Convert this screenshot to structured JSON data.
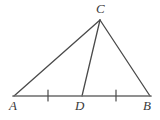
{
  "figure": {
    "kind": "geometry-diagram",
    "background_color": "#ffffff",
    "stroke_color": "#4a4a4a",
    "base_stroke_color": "#6b6b6b",
    "label_color": "#3a3a3a",
    "width": 160,
    "height": 120,
    "points": {
      "A": {
        "label": "A",
        "x": 14,
        "y": 96
      },
      "B": {
        "label": "B",
        "x": 150,
        "y": 96
      },
      "C": {
        "label": "C",
        "x": 100,
        "y": 20
      },
      "D": {
        "label": "D",
        "x": 82,
        "y": 96
      }
    },
    "segments": [
      {
        "name": "side-AC",
        "from": "A",
        "to": "C"
      },
      {
        "name": "side-CB",
        "from": "C",
        "to": "B"
      },
      {
        "name": "base-AB",
        "from": "A",
        "to": "B"
      },
      {
        "name": "cevian-CD",
        "from": "C",
        "to": "D"
      }
    ],
    "tick_marks": [
      {
        "name": "tick-AD",
        "on": "AD",
        "x": 48,
        "y": 96,
        "count": 1
      },
      {
        "name": "tick-DB",
        "on": "DB",
        "x": 116,
        "y": 96,
        "count": 1
      }
    ]
  }
}
